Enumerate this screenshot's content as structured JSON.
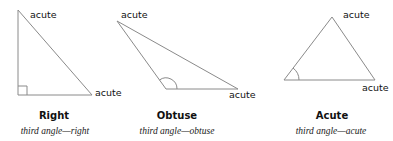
{
  "diagram": {
    "line_color": "#8a8a8a",
    "triangles": [
      {
        "name": "Right",
        "caption": "third angle—right",
        "vertices": [
          [
            18,
            10
          ],
          [
            18,
            95
          ],
          [
            92,
            95
          ]
        ],
        "labels": [
          "acute",
          "acute"
        ]
      },
      {
        "name": "Obtuse",
        "caption": "third angle—obtuse",
        "vertices": [
          [
            117,
            21
          ],
          [
            166,
            89
          ],
          [
            238,
            89
          ]
        ],
        "labels": [
          "acute",
          "acute"
        ]
      },
      {
        "name": "Acute",
        "caption": "third angle—acute",
        "vertices": [
          [
            332,
            17
          ],
          [
            284,
            80
          ],
          [
            375,
            80
          ]
        ],
        "labels": [
          "acute",
          "acute"
        ]
      }
    ]
  }
}
